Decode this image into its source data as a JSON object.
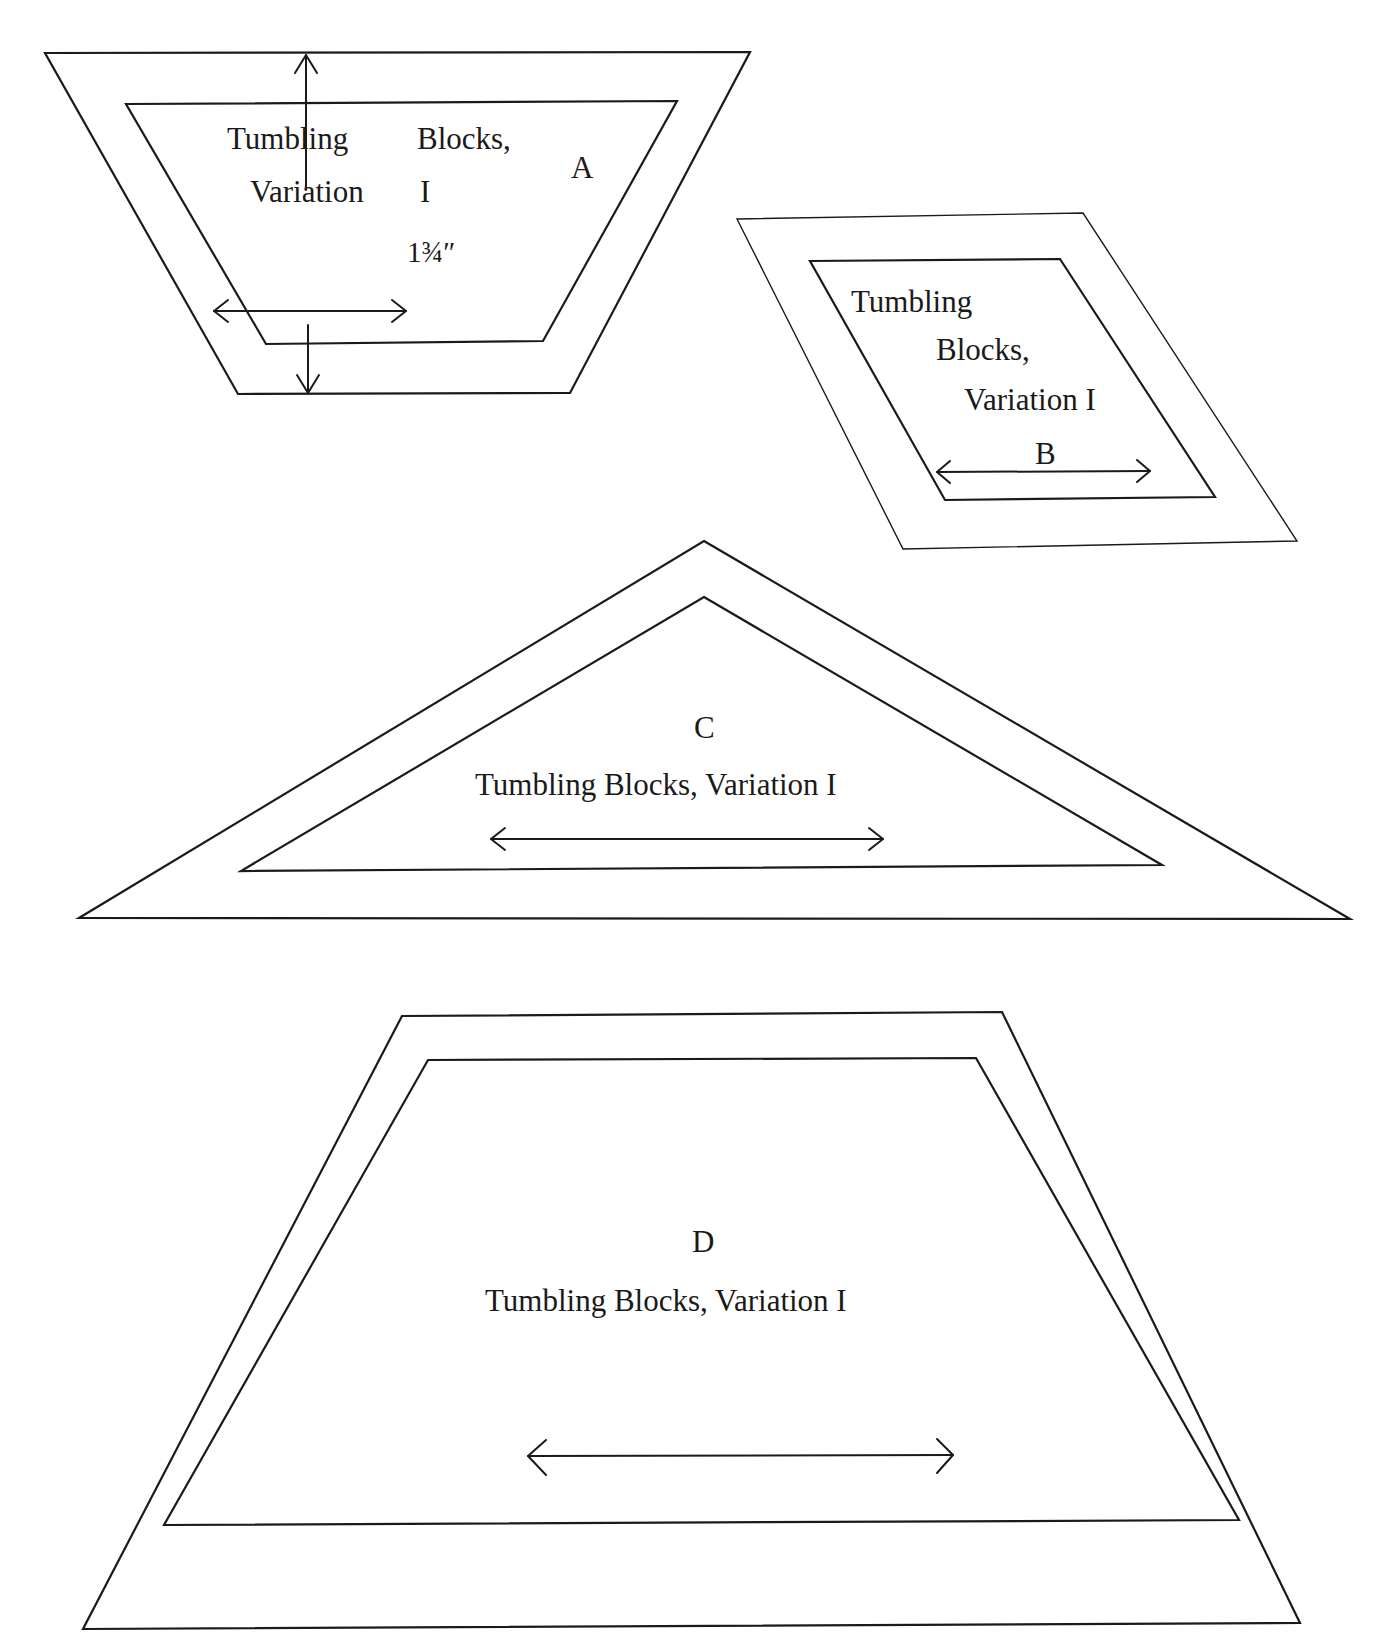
{
  "diagram": {
    "pieces": [
      {
        "id": "A",
        "shape": "trapezoid (inverted)",
        "letter": "A",
        "name_line1_left": "Tumbling",
        "name_line1_right": "Blocks,",
        "name_line2_left": "Variation",
        "name_line2_right": "I",
        "dimension": "1¾″",
        "grain_arrow": "horizontal double-headed",
        "seam_allowance_arrow": "vertical, from outer top edge to outer bottom edge"
      },
      {
        "id": "B",
        "shape": "parallelogram",
        "letter": "B",
        "name_line1": "Tumbling",
        "name_line2": "Blocks,",
        "name_line3": "Variation I",
        "grain_arrow": "horizontal double-headed"
      },
      {
        "id": "C",
        "shape": "triangle",
        "letter": "C",
        "name": "Tumbling Blocks, Variation I",
        "grain_arrow": "horizontal double-headed"
      },
      {
        "id": "D",
        "shape": "trapezoid",
        "letter": "D",
        "name": "Tumbling Blocks, Variation I",
        "grain_arrow": "horizontal double-headed"
      }
    ],
    "colors": {
      "line": "#1a1a1a",
      "background": "#ffffff"
    }
  }
}
